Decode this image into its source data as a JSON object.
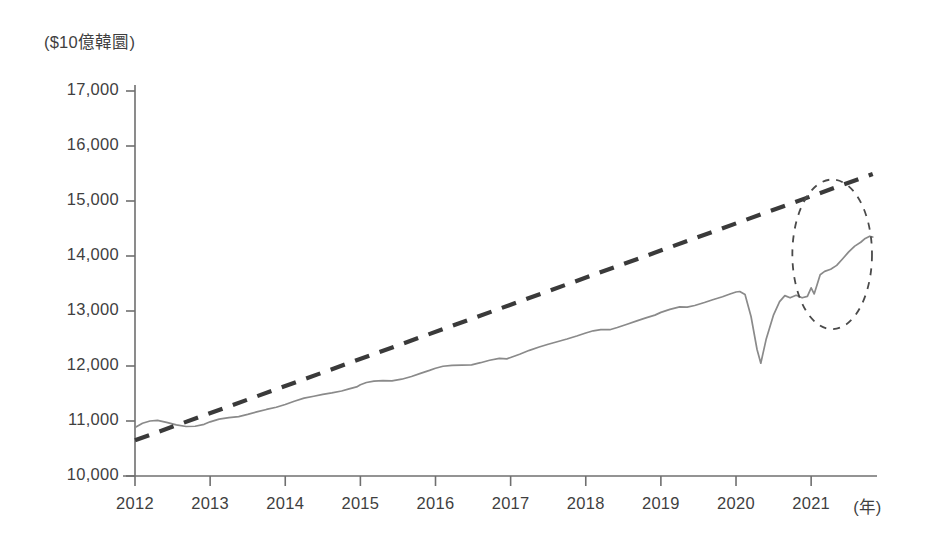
{
  "figure": {
    "y_unit_label": "($10億韓圜)",
    "x_unit_label": "(年)",
    "background_color": "#ffffff",
    "series_color": "#8a8a8a",
    "trend_color": "#3a3a3a",
    "annotation_color": "#4a4a4a",
    "axis_color": "#6f6f6f"
  },
  "axes": {
    "y_ticks": [
      "10,000",
      "11,000",
      "12,000",
      "13,000",
      "14,000",
      "15,000",
      "16,000",
      "17,000"
    ],
    "x_ticks": [
      "2012",
      "2013",
      "2014",
      "2015",
      "2016",
      "2017",
      "2018",
      "2019",
      "2020",
      "2021"
    ]
  },
  "chart_data": {
    "type": "line",
    "title": "",
    "subtitle": "",
    "xlabel": "(年)",
    "ylabel": "($10億韓圜)",
    "xlim": [
      2012,
      2021.85
    ],
    "ylim": [
      10000,
      17000
    ],
    "grid": false,
    "legend": "none",
    "x_tick_values": [
      2012,
      2013,
      2014,
      2015,
      2016,
      2017,
      2018,
      2019,
      2020,
      2021
    ],
    "x_tick_labels": [
      "2012",
      "2013",
      "2014",
      "2015",
      "2016",
      "2017",
      "2018",
      "2019",
      "2020",
      "2021"
    ],
    "y_tick_values": [
      10000,
      11000,
      12000,
      13000,
      14000,
      15000,
      16000,
      17000
    ],
    "y_tick_labels": [
      "10,000",
      "11,000",
      "12,000",
      "13,000",
      "14,000",
      "15,000",
      "16,000",
      "17,000"
    ],
    "series": [
      {
        "name": "actual",
        "style": "solid",
        "color": "#8a8a8a",
        "points": [
          [
            2012.0,
            10880
          ],
          [
            2012.1,
            10960
          ],
          [
            2012.2,
            11000
          ],
          [
            2012.3,
            11010
          ],
          [
            2012.42,
            10975
          ],
          [
            2012.55,
            10930
          ],
          [
            2012.68,
            10900
          ],
          [
            2012.8,
            10905
          ],
          [
            2012.92,
            10940
          ],
          [
            2013.0,
            10985
          ],
          [
            2013.12,
            11035
          ],
          [
            2013.25,
            11060
          ],
          [
            2013.38,
            11080
          ],
          [
            2013.5,
            11120
          ],
          [
            2013.62,
            11165
          ],
          [
            2013.75,
            11210
          ],
          [
            2013.88,
            11250
          ],
          [
            2014.0,
            11300
          ],
          [
            2014.12,
            11360
          ],
          [
            2014.25,
            11415
          ],
          [
            2014.38,
            11450
          ],
          [
            2014.5,
            11485
          ],
          [
            2014.62,
            11510
          ],
          [
            2014.75,
            11545
          ],
          [
            2014.85,
            11585
          ],
          [
            2014.95,
            11620
          ],
          [
            2015.0,
            11660
          ],
          [
            2015.08,
            11700
          ],
          [
            2015.18,
            11725
          ],
          [
            2015.3,
            11735
          ],
          [
            2015.42,
            11730
          ],
          [
            2015.55,
            11760
          ],
          [
            2015.68,
            11810
          ],
          [
            2015.8,
            11865
          ],
          [
            2015.92,
            11920
          ],
          [
            2016.0,
            11960
          ],
          [
            2016.1,
            11995
          ],
          [
            2016.22,
            12010
          ],
          [
            2016.35,
            12015
          ],
          [
            2016.48,
            12020
          ],
          [
            2016.6,
            12060
          ],
          [
            2016.72,
            12105
          ],
          [
            2016.85,
            12140
          ],
          [
            2016.95,
            12130
          ],
          [
            2017.0,
            12155
          ],
          [
            2017.12,
            12215
          ],
          [
            2017.25,
            12285
          ],
          [
            2017.38,
            12345
          ],
          [
            2017.5,
            12395
          ],
          [
            2017.62,
            12440
          ],
          [
            2017.75,
            12490
          ],
          [
            2017.88,
            12545
          ],
          [
            2018.0,
            12600
          ],
          [
            2018.1,
            12640
          ],
          [
            2018.2,
            12660
          ],
          [
            2018.32,
            12660
          ],
          [
            2018.42,
            12700
          ],
          [
            2018.55,
            12760
          ],
          [
            2018.68,
            12820
          ],
          [
            2018.8,
            12875
          ],
          [
            2018.92,
            12925
          ],
          [
            2019.0,
            12975
          ],
          [
            2019.12,
            13030
          ],
          [
            2019.25,
            13075
          ],
          [
            2019.35,
            13070
          ],
          [
            2019.45,
            13100
          ],
          [
            2019.58,
            13155
          ],
          [
            2019.7,
            13210
          ],
          [
            2019.82,
            13260
          ],
          [
            2019.92,
            13310
          ],
          [
            2020.0,
            13345
          ],
          [
            2020.05,
            13355
          ],
          [
            2020.12,
            13300
          ],
          [
            2020.2,
            12900
          ],
          [
            2020.28,
            12300
          ],
          [
            2020.33,
            12050
          ],
          [
            2020.4,
            12480
          ],
          [
            2020.5,
            12930
          ],
          [
            2020.58,
            13170
          ],
          [
            2020.65,
            13280
          ],
          [
            2020.72,
            13240
          ],
          [
            2020.8,
            13285
          ],
          [
            2020.88,
            13240
          ],
          [
            2020.95,
            13265
          ],
          [
            2021.0,
            13420
          ],
          [
            2021.04,
            13310
          ],
          [
            2021.08,
            13480
          ],
          [
            2021.12,
            13660
          ],
          [
            2021.18,
            13720
          ],
          [
            2021.26,
            13760
          ],
          [
            2021.34,
            13830
          ],
          [
            2021.42,
            13950
          ],
          [
            2021.5,
            14075
          ],
          [
            2021.58,
            14180
          ],
          [
            2021.66,
            14250
          ],
          [
            2021.72,
            14320
          ],
          [
            2021.78,
            14360
          ],
          [
            2021.82,
            14345
          ]
        ]
      },
      {
        "name": "trend",
        "style": "dashed",
        "color": "#3a3a3a",
        "points": [
          [
            2012.0,
            10650
          ],
          [
            2021.82,
            15490
          ]
        ]
      }
    ],
    "annotations": [
      {
        "type": "ellipse",
        "name": "divergence-highlight",
        "style": "dashed",
        "center_x": 2021.28,
        "center_y": 14030,
        "radius_x_years": 0.53,
        "radius_y_value": 1360
      }
    ]
  }
}
